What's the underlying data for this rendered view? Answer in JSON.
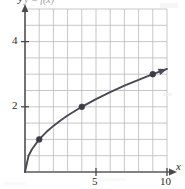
{
  "chart_data": {
    "type": "line",
    "title": "",
    "subtitle": "",
    "top_label": "y = f(x)",
    "xlabel": "x",
    "ylabel": "y",
    "xlim": [
      0,
      10
    ],
    "ylim": [
      0,
      5
    ],
    "grid": true,
    "grid_step_x": 1,
    "grid_step_y": 0.5,
    "legend": "none",
    "x_tick_labels": [
      "5",
      "10"
    ],
    "x_tick_values": [
      5,
      10
    ],
    "y_tick_labels": [
      "2",
      "4"
    ],
    "y_tick_values": [
      2,
      4
    ],
    "series": [
      {
        "name": "y = sqrt(x)",
        "style": "curve-with-arrowhead",
        "color": "#4a4a55",
        "x": [
          0,
          0.25,
          0.5,
          1,
          1.5,
          2,
          2.5,
          3,
          4,
          5,
          6,
          7,
          8,
          9,
          10
        ],
        "values": [
          0,
          0.5,
          0.707,
          1,
          1.225,
          1.414,
          1.581,
          1.732,
          2,
          2.236,
          2.449,
          2.646,
          2.828,
          3,
          3.162
        ],
        "markers": [
          {
            "x": 1,
            "y": 1
          },
          {
            "x": 4,
            "y": 2
          },
          {
            "x": 9,
            "y": 3
          }
        ]
      }
    ],
    "annotations": [
      {
        "kind": "arrowhead",
        "on": "y-axis",
        "position": "top"
      },
      {
        "kind": "arrowhead",
        "on": "x-axis",
        "position": "right"
      },
      {
        "kind": "arrowhead",
        "on": "curve",
        "position": "end"
      }
    ],
    "colors": {
      "curve": "#4a4a55",
      "axis": "#5a5a5a",
      "grid": "#b9b9bd",
      "marker": "#3c3c46",
      "text": "#2b2b2b"
    }
  }
}
